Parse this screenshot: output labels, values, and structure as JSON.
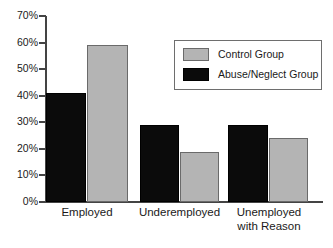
{
  "chart_data": {
    "type": "bar",
    "title": "",
    "xlabel": "",
    "ylabel": "",
    "ylim": [
      0,
      70
    ],
    "grid": false,
    "legend_position": "top-right",
    "categories": [
      "Employed",
      "Underemployed",
      "Unemployed\nwith Reason"
    ],
    "ytick_labels": [
      "0%",
      "10%",
      "20%",
      "30%",
      "40%",
      "50%",
      "60%",
      "70%"
    ],
    "ytick_values": [
      0,
      10,
      20,
      30,
      40,
      50,
      60,
      70
    ],
    "series": [
      {
        "name": "Abuse/Neglect Group",
        "color": "#0b0b0b",
        "values": [
          41,
          29,
          29
        ]
      },
      {
        "name": "Control Group",
        "color": "#b4b4b4",
        "values": [
          59,
          19,
          24
        ]
      }
    ]
  },
  "legend": {
    "entries": [
      {
        "label": "Control Group",
        "swatch": "light"
      },
      {
        "label": "Abuse/Neglect Group",
        "swatch": "dark"
      }
    ]
  },
  "axis": {
    "axis_color": "#444444"
  }
}
